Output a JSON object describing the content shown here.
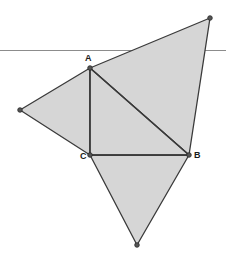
{
  "figure": {
    "canvas": {
      "width": 226,
      "height": 269
    },
    "background_color": "#ffffff",
    "fill_color": "#d6d6d6",
    "stroke_color": "#3a3a3a",
    "reference_line_color": "#8c8c8c",
    "point_fill_color": "#555555",
    "points": [
      {
        "id": "A",
        "label": "A",
        "x": 90,
        "y": 68,
        "labeled": true,
        "label_x": 85,
        "label_y": 54
      },
      {
        "id": "B",
        "label": "B",
        "x": 189,
        "y": 155,
        "labeled": true,
        "label_x": 194,
        "label_y": 151
      },
      {
        "id": "C",
        "label": "C",
        "x": 90,
        "y": 155,
        "labeled": true,
        "label_x": 80,
        "label_y": 152
      },
      {
        "id": "D",
        "label": "",
        "x": 210,
        "y": 18,
        "labeled": false,
        "label_x": 0,
        "label_y": 0
      },
      {
        "id": "E",
        "label": "",
        "x": 20,
        "y": 110,
        "labeled": false,
        "label_x": 0,
        "label_y": 0
      },
      {
        "id": "F",
        "label": "",
        "x": 137,
        "y": 245,
        "labeled": false,
        "label_x": 0,
        "label_y": 0
      }
    ],
    "polygons": [
      {
        "id": "triangle-abc-core",
        "name": "core-right-triangle-ABC",
        "points": "90,68 189,155 90,155"
      },
      {
        "id": "triangle-upper-right",
        "name": "upper-right-triangle-on-hypotenuse-AB",
        "points": "90,68 210,18 189,155"
      },
      {
        "id": "triangle-left",
        "name": "left-triangle-on-leg-AC",
        "points": "90,68 20,110 90,155"
      },
      {
        "id": "triangle-bottom",
        "name": "bottom-triangle-on-leg-CB",
        "points": "90,155 137,245 189,155"
      }
    ],
    "segments": [
      {
        "id": "seg-AC",
        "name": "segment-AC-vertical-leg",
        "x1": 90,
        "y1": 68,
        "x2": 90,
        "y2": 155
      },
      {
        "id": "seg-CB",
        "name": "segment-CB-horizontal-leg",
        "x1": 90,
        "y1": 155,
        "x2": 189,
        "y2": 155
      },
      {
        "id": "seg-AB",
        "name": "segment-AB-hypotenuse",
        "x1": 90,
        "y1": 68,
        "x2": 189,
        "y2": 155
      }
    ],
    "reference_line": {
      "id": "horizontal-reference-line",
      "x1": 0,
      "y1": 50,
      "x2": 226,
      "y2": 50
    }
  }
}
